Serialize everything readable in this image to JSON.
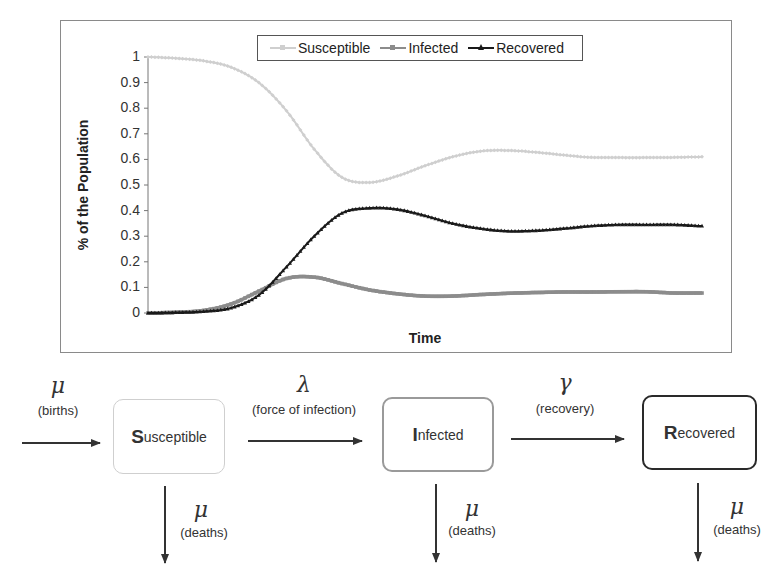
{
  "chart_data": {
    "type": "line",
    "title": "",
    "xlabel": "Time",
    "ylabel": "% of the Population",
    "ylim": [
      0,
      1
    ],
    "yticks": [
      "0",
      "0.1",
      "0.2",
      "0.3",
      "0.4",
      "0.5",
      "0.6",
      "0.7",
      "0.8",
      "0.9",
      "1"
    ],
    "xticks": [],
    "grid": false,
    "legend_position": "top-center",
    "x": [
      0,
      5,
      10,
      15,
      20,
      25,
      30,
      35,
      40,
      45,
      50,
      55,
      60,
      65,
      70,
      75,
      80,
      85,
      90,
      95,
      100
    ],
    "series": [
      {
        "name": "Susceptible",
        "color": "#cfcfcf",
        "marker": "diamond",
        "values": [
          1.0,
          0.995,
          0.985,
          0.96,
          0.9,
          0.79,
          0.64,
          0.53,
          0.51,
          0.535,
          0.575,
          0.61,
          0.632,
          0.635,
          0.628,
          0.617,
          0.608,
          0.607,
          0.607,
          0.608,
          0.61
        ]
      },
      {
        "name": "Infected",
        "color": "#8c8c8c",
        "marker": "square",
        "values": [
          0.0,
          0.003,
          0.01,
          0.035,
          0.085,
          0.135,
          0.14,
          0.115,
          0.09,
          0.075,
          0.066,
          0.066,
          0.072,
          0.077,
          0.08,
          0.082,
          0.082,
          0.083,
          0.083,
          0.078,
          0.078
        ]
      },
      {
        "name": "Recovered",
        "color": "#1a1a1a",
        "marker": "triangle",
        "values": [
          0.0,
          0.002,
          0.006,
          0.02,
          0.07,
          0.18,
          0.3,
          0.39,
          0.41,
          0.405,
          0.38,
          0.35,
          0.33,
          0.32,
          0.322,
          0.33,
          0.34,
          0.345,
          0.345,
          0.345,
          0.34
        ]
      }
    ]
  },
  "diagram": {
    "compartments": [
      {
        "id": "S",
        "initial": "S",
        "rest": "usceptible"
      },
      {
        "id": "I",
        "initial": "I",
        "rest": "nfected"
      },
      {
        "id": "R",
        "initial": "R",
        "rest": "ecovered"
      }
    ],
    "flows": {
      "births": {
        "symbol": "μ",
        "label": "(births)"
      },
      "infection": {
        "symbol": "λ",
        "label": "(force of infection)"
      },
      "recovery": {
        "symbol": "γ",
        "label": "(recovery)"
      },
      "deaths_s": {
        "symbol": "μ",
        "label": "(deaths)"
      },
      "deaths_i": {
        "symbol": "μ",
        "label": "(deaths)"
      },
      "deaths_r": {
        "symbol": "μ",
        "label": "(deaths)"
      }
    }
  }
}
